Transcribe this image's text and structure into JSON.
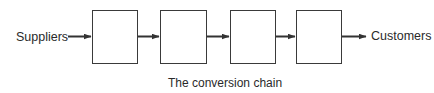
{
  "diagram": {
    "type": "flow-chain",
    "input_label": "Suppliers",
    "output_label": "Customers",
    "stage_count": 4,
    "stages": [
      {
        "label": ""
      },
      {
        "label": ""
      },
      {
        "label": ""
      },
      {
        "label": ""
      }
    ],
    "caption": "The conversion chain",
    "colors": {
      "stroke": "#333333",
      "text": "#2a2a2a",
      "background": "#ffffff"
    }
  }
}
